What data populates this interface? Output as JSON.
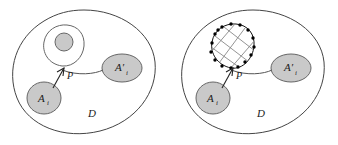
{
  "figure": {
    "name": "two-panel-domain-diagram",
    "panels": [
      {
        "id": "left",
        "domain_label": "D",
        "source_blob_label": "A",
        "source_blob_subscript": "i",
        "target_blob_label": "A′",
        "target_blob_subscript": "i",
        "point_label": "P",
        "inclusion_type": "smooth-loop-with-small-disk"
      },
      {
        "id": "right",
        "domain_label": "D",
        "source_blob_label": "A",
        "source_blob_subscript": "i",
        "target_blob_label": "A′",
        "target_blob_subscript": "i",
        "point_label": "P",
        "inclusion_type": "discretized-mesh-circle"
      }
    ],
    "colors": {
      "blob_fill": "#c9c9c9",
      "blob_stroke": "#666666",
      "domain_stroke": "#444444",
      "mesh_node": "#000000",
      "mesh_line": "#888888",
      "background": "#ffffff",
      "label_text": "#1a1a1a"
    },
    "mesh": {
      "node_count": 16,
      "grid_lines": 6
    }
  }
}
